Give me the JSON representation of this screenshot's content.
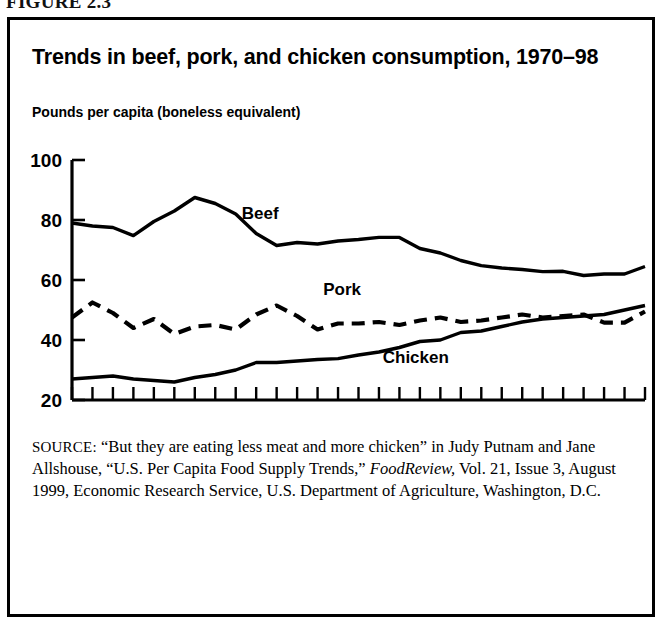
{
  "figure": {
    "number_label": "FIGURE 2.3"
  },
  "chart_title": "Trends in beef, pork, and chicken consumption, 1970–98",
  "axis_unit_label": "Pounds per capita (boneless equivalent)",
  "source": {
    "label": "SOURCE:",
    "line1": " “But they are eating less meat and more chicken” in Judy",
    "line2": "Putnam and Jane Allshouse, “U.S. Per Capita Food Supply Trends,”",
    "italic_title": "FoodReview,",
    "line3_rest": " Vol. 21, Issue 3, August 1999, Economic Research",
    "line4": "Service, U.S. Department of Agriculture, Washington, D.C."
  },
  "chart_data": {
    "type": "line",
    "title": "Trends in beef, pork, and chicken consumption, 1970–98",
    "xlabel": "",
    "ylabel": "Pounds per capita (boneless equivalent)",
    "xlim": [
      1970,
      1998
    ],
    "ylim": [
      20,
      100
    ],
    "yticks": [
      20,
      40,
      60,
      80,
      100
    ],
    "ytick_labels": [
      "20",
      "40",
      "60",
      "80",
      "100"
    ],
    "xticks": [
      1970,
      1975,
      1980,
      1985,
      1990,
      1995
    ],
    "xtick_labels": [
      "1970",
      "75",
      "80",
      "85",
      "90",
      "95"
    ],
    "minor_xticks_every": 1,
    "grid": false,
    "legend": "inline-annotations",
    "x": [
      1970,
      1971,
      1972,
      1973,
      1974,
      1975,
      1976,
      1977,
      1978,
      1979,
      1980,
      1981,
      1982,
      1983,
      1984,
      1985,
      1986,
      1987,
      1988,
      1989,
      1990,
      1991,
      1992,
      1993,
      1994,
      1995,
      1996,
      1997,
      1998
    ],
    "series": [
      {
        "name": "Beef",
        "style": "solid",
        "color": "#000000",
        "label_x": 1979.2,
        "label_y": 80.5,
        "values": [
          79.0,
          78.0,
          77.5,
          74.8,
          79.5,
          83.0,
          87.5,
          85.5,
          82.0,
          75.5,
          71.5,
          72.5,
          72.0,
          73.0,
          73.5,
          74.2,
          74.2,
          70.5,
          69.0,
          66.5,
          64.8,
          64.0,
          63.5,
          62.8,
          62.9,
          61.5,
          62.0,
          62.0,
          64.5
        ]
      },
      {
        "name": "Pork",
        "style": "dashed",
        "color": "#000000",
        "label_x": 1983.2,
        "label_y": 55.0,
        "values": [
          47.5,
          52.5,
          49.0,
          44.0,
          47.0,
          42.0,
          44.5,
          45.0,
          43.5,
          48.5,
          51.5,
          48.0,
          43.5,
          45.5,
          45.5,
          46.0,
          45.0,
          46.5,
          47.5,
          46.0,
          46.5,
          47.5,
          48.5,
          47.5,
          48.0,
          48.5,
          45.8,
          45.8,
          49.5
        ]
      },
      {
        "name": "Chicken",
        "style": "solid",
        "color": "#000000",
        "label_x": 1986.8,
        "label_y": 32.5,
        "values": [
          27.0,
          27.5,
          28.0,
          27.0,
          26.5,
          26.0,
          27.5,
          28.5,
          30.0,
          32.5,
          32.5,
          33.0,
          33.5,
          33.8,
          35.0,
          36.0,
          37.5,
          39.5,
          40.0,
          42.5,
          43.0,
          44.5,
          46.0,
          47.0,
          47.5,
          48.0,
          48.5,
          50.0,
          51.5
        ]
      }
    ]
  }
}
